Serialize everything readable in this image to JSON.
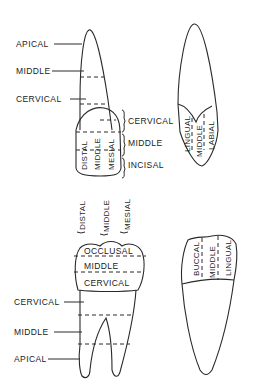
{
  "figure": {
    "incisor_proximal_view": {
      "root_labels": [
        "APICAL",
        "MIDDLE",
        "CERVICAL"
      ],
      "crown_vertical_labels": [
        "DISTAL",
        "MIDDLE",
        "MESIAL"
      ],
      "crown_side_labels": [
        "CERVICAL",
        "MIDDLE",
        "INCISAL"
      ]
    },
    "incisor_side_view": {
      "crown_vertical_labels": [
        "LINGUAL",
        "MIDDLE",
        "LABIAL"
      ]
    },
    "molar_proximal_view": {
      "top_vertical_labels": [
        "DISTAL",
        "MIDDLE",
        "MESIAL"
      ],
      "crown_labels": [
        "OCCLUSAL",
        "MIDDLE",
        "CERVICAL"
      ],
      "root_labels": [
        "CERVICAL",
        "MIDDLE",
        "APICAL"
      ]
    },
    "molar_side_view": {
      "crown_vertical_labels": [
        "BUCCAL",
        "MIDDLE",
        "LINGUAL"
      ]
    }
  }
}
